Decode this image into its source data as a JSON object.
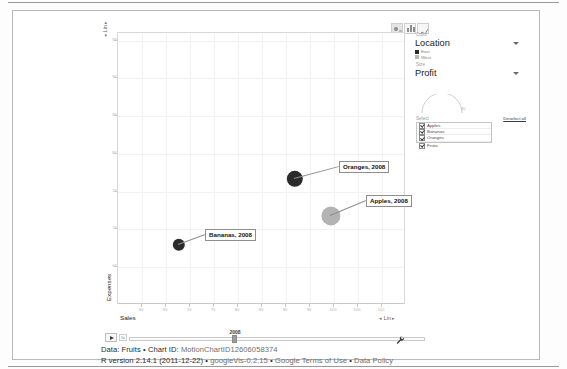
{
  "chart_type_toggles": [
    {
      "name": "bubble-chart-toggle",
      "label": "Bubbles",
      "active": true
    },
    {
      "name": "bar-chart-toggle",
      "label": "Bars",
      "active": false
    },
    {
      "name": "line-chart-toggle",
      "label": "Lines",
      "active": false
    }
  ],
  "axes": {
    "y_scale": "Lin",
    "x_scale": "Lin",
    "y_title": "Expenses",
    "x_title": "Sales"
  },
  "controls": {
    "color_section_label": "Color",
    "color_value": "Location",
    "color_legend": [
      {
        "label": "East",
        "color": "#2b2b2b"
      },
      {
        "label": "West",
        "color": "#b8b8b8"
      }
    ],
    "size_section_label": "Size",
    "size_value": "Profit",
    "size_arc_value": "10",
    "select_label": "Select",
    "deselect_all_label": "Deselect all",
    "select_items": [
      {
        "label": "Apples",
        "checked": true
      },
      {
        "label": "Bananas",
        "checked": true
      },
      {
        "label": "Oranges",
        "checked": true
      },
      {
        "label": "Fruits",
        "checked": true
      }
    ]
  },
  "playback": {
    "play_label": "Play",
    "speed_label": "1x",
    "current_year": "2008"
  },
  "footer": {
    "line1_strong": "Data: Fruits",
    "line1_sep1": " • ",
    "line1_label": "Chart ID: ",
    "line1_id": "MotionChartID12606058374",
    "line2_version": "R version 2.14.1 (2011-12-22)",
    "line2_sep1": " • ",
    "line2_lib": "googleVis-0.2.15",
    "line2_sep2": " • ",
    "line2_terms": "Google Terms of Use",
    "line2_sep3": " • ",
    "line2_policy": "Data Policy"
  },
  "chart_data": {
    "type": "scatter",
    "title": "",
    "xlabel": "Sales",
    "ylabel": "Expenses",
    "xlim": [
      55,
      115
    ],
    "ylim": [
      60,
      96
    ],
    "grid": true,
    "legend": "right",
    "xticks": [
      60,
      65,
      70,
      75,
      80,
      85,
      90,
      95,
      100,
      105,
      110
    ],
    "yticks": [
      65,
      70,
      75,
      80,
      85,
      90,
      95
    ],
    "size_variable": "Profit",
    "color_variable": "Location",
    "year": "2008",
    "points": [
      {
        "label": "Oranges, 2008",
        "name": "Oranges",
        "x": 90,
        "y": 85,
        "size": 9,
        "color": "#2b2b2b",
        "location": "East",
        "px": 177,
        "py": 146,
        "radius": 8.2,
        "label_x": 222,
        "label_y": 129
      },
      {
        "label": "Apples, 2008",
        "name": "Apples",
        "x": 98,
        "y": 78,
        "size": 11,
        "color": "#b3b3b3",
        "location": "West",
        "px": 213,
        "py": 183,
        "radius": 9.6,
        "label_x": 249,
        "label_y": 163
      },
      {
        "label": "Bananas, 2008",
        "name": "Bananas",
        "x": 72,
        "y": 72,
        "size": 7,
        "color": "#2b2b2b",
        "location": "East",
        "px": 61,
        "py": 212,
        "radius": 6.2,
        "label_x": 88,
        "label_y": 197
      }
    ]
  }
}
